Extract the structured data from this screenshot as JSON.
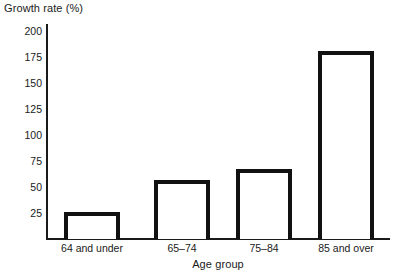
{
  "chart_data": {
    "type": "bar",
    "title": "",
    "xlabel": "Age group",
    "ylabel": "Growth rate (%)",
    "categories": [
      "64 and under",
      "65–74",
      "75–84",
      "85 and over"
    ],
    "values": [
      25,
      55,
      65,
      175
    ],
    "ylim": [
      0,
      200
    ],
    "yticks": [
      25,
      50,
      75,
      100,
      125,
      150,
      175,
      200
    ],
    "ytick_labels": [
      "25",
      "50",
      "75",
      "100",
      "125",
      "150",
      "175",
      "200"
    ],
    "grid": false,
    "legend": false,
    "bar_style": {
      "fill": "#ffffff",
      "outline": "#111111",
      "outline_width_px": 4
    },
    "axis_color": "#1a1a1a"
  },
  "axes": {
    "y_title": "Growth rate (%)",
    "x_title": "Age group"
  }
}
